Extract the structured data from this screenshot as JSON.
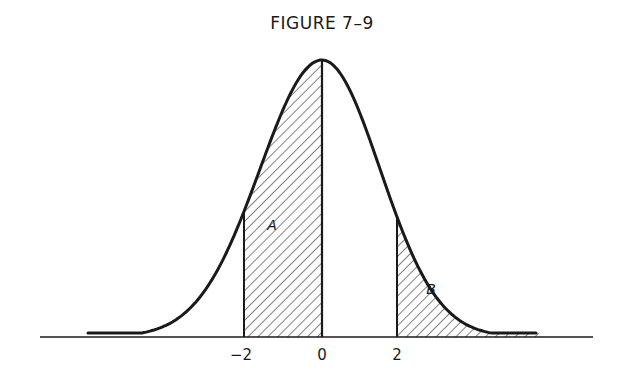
{
  "figure": {
    "title": "FIGURE 7–9"
  },
  "chart_data": {
    "type": "area",
    "title": "FIGURE 7–9",
    "xlabel": "",
    "ylabel": "",
    "x_ticks": [
      "−2",
      "0",
      "2"
    ],
    "x_tick_values": [
      -2,
      0,
      2
    ],
    "xlim": [
      -4.6,
      4.2
    ],
    "curve": "normal density, mean 0",
    "regions": [
      {
        "label": "A",
        "from": -2,
        "to": 0,
        "hatched": true
      },
      {
        "label": "B",
        "from": 2,
        "to": 4.0,
        "hatched": true
      }
    ],
    "grid": false,
    "legend": null
  },
  "colors": {
    "ink": "#1a1a1a",
    "background": "#ffffff"
  }
}
